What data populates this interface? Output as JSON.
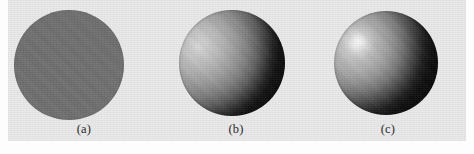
{
  "figure": {
    "background_color": "#e9e9e9",
    "page_color": "#ffffff",
    "panel_count": 3
  },
  "panels": [
    {
      "label": "(a)",
      "icon": "sphere-flat-icon",
      "shading_model": "ambient only",
      "base_color": "#6f6f6f",
      "highlight": "none",
      "terminator": "none"
    },
    {
      "label": "(b)",
      "icon": "sphere-diffuse-icon",
      "shading_model": "ambient plus diffuse",
      "base_color": "#d9d9d9",
      "shadow_color": "#070707",
      "highlight": "none",
      "light_direction": "upper-left"
    },
    {
      "label": "(c)",
      "icon": "sphere-specular-icon",
      "shading_model": "ambient plus diffuse plus specular",
      "base_color": "#cfcfcf",
      "shadow_color": "#050505",
      "highlight": "#ffffff",
      "light_direction": "upper-left"
    }
  ]
}
